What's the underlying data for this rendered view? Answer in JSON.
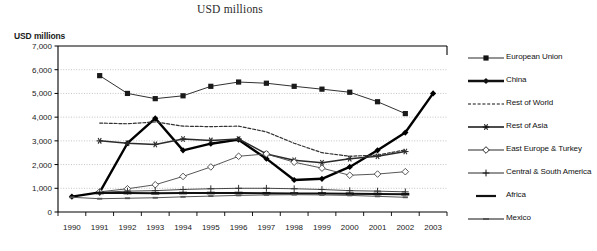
{
  "chart_data": {
    "type": "line",
    "title": "USD millions",
    "ylabel": "USD millions",
    "xlabel": "",
    "grid": true,
    "legend_position": "right",
    "ylim": [
      0,
      7000
    ],
    "yticks": [
      "0",
      "1,000",
      "2,000",
      "3,000",
      "4,000",
      "5,000",
      "6,000",
      "7,000"
    ],
    "ytick_values": [
      0,
      1000,
      2000,
      3000,
      4000,
      5000,
      6000,
      7000
    ],
    "categories": [
      "1990",
      "1991",
      "1992",
      "1993",
      "1994",
      "1995",
      "1996",
      "1997",
      "1998",
      "1999",
      "2000",
      "2001",
      "2002",
      "2003"
    ],
    "x": [
      1990,
      1991,
      1992,
      1993,
      1994,
      1995,
      1996,
      1997,
      1998,
      1999,
      2000,
      2001,
      2002,
      2003
    ],
    "series": [
      {
        "name": "European Union",
        "marker": "filled-square",
        "line": "thin-solid",
        "color": "#1a1a1a",
        "values": [
          null,
          5750,
          5000,
          4780,
          4900,
          5300,
          5480,
          5430,
          5300,
          5180,
          5050,
          4650,
          4150,
          null
        ]
      },
      {
        "name": "China",
        "marker": "filled-diamond",
        "line": "thick-solid",
        "color": "#000000",
        "values": [
          650,
          830,
          2900,
          3950,
          2600,
          2880,
          3050,
          2250,
          1350,
          1400,
          1900,
          2600,
          3350,
          5000
        ]
      },
      {
        "name": "Rest of World",
        "marker": "none",
        "line": "dashed",
        "color": "#333333",
        "values": [
          null,
          3750,
          3720,
          3800,
          3620,
          3600,
          3620,
          3380,
          2900,
          2500,
          2350,
          2400,
          2620,
          null
        ]
      },
      {
        "name": "Rest of Asia",
        "marker": "asterisk",
        "line": "medium-solid",
        "color": "#2b2b2b",
        "values": [
          null,
          3000,
          2900,
          2850,
          3080,
          3020,
          3080,
          2450,
          2180,
          2080,
          2250,
          2350,
          2550,
          null
        ]
      },
      {
        "name": "East Europe & Turkey",
        "marker": "open-diamond",
        "line": "thin-solid",
        "color": "#444444",
        "values": [
          null,
          850,
          980,
          1150,
          1500,
          1900,
          2350,
          2450,
          2100,
          1850,
          1550,
          1600,
          1700,
          null
        ]
      },
      {
        "name": "Central & South America",
        "marker": "plus",
        "line": "thin-solid",
        "color": "#333333",
        "values": [
          null,
          830,
          880,
          900,
          950,
          980,
          1000,
          1000,
          980,
          950,
          900,
          880,
          850,
          null
        ]
      },
      {
        "name": "Africa",
        "marker": "dash",
        "line": "thick-short",
        "color": "#111111",
        "values": [
          null,
          800,
          800,
          790,
          800,
          800,
          800,
          790,
          780,
          780,
          770,
          760,
          750,
          null
        ]
      },
      {
        "name": "Mexico",
        "marker": "small-dash",
        "line": "thin-gray",
        "color": "#555555",
        "values": [
          620,
          560,
          580,
          600,
          640,
          670,
          700,
          720,
          730,
          720,
          700,
          660,
          620,
          null
        ]
      }
    ]
  },
  "legend": {
    "items": [
      {
        "label": "European Union",
        "key": "filled-square-key"
      },
      {
        "label": "China",
        "key": "filled-diamond-key"
      },
      {
        "label": "Rest of World",
        "key": "dashed-key"
      },
      {
        "label": "Rest of Asia",
        "key": "asterisk-key"
      },
      {
        "label": "East Europe & Turkey",
        "key": "open-diamond-key"
      },
      {
        "label": "Central & South America",
        "key": "plus-key"
      },
      {
        "label": "Africa",
        "key": "thick-dash-key"
      },
      {
        "label": "Mexico",
        "key": "gray-dash-key"
      }
    ]
  }
}
